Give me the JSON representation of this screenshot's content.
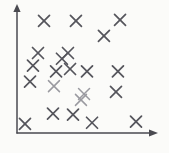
{
  "chart_data": {
    "type": "scatter",
    "title": "",
    "subtitle": "",
    "xlabel": "",
    "ylabel": "",
    "xlim": [
      0,
      100
    ],
    "ylim": [
      0,
      100
    ],
    "grid": false,
    "legend": null,
    "legend_position": "none",
    "tick_labels": {
      "x": [],
      "y": []
    },
    "annotations": [],
    "marker": "x",
    "marker_color": "#55555c",
    "axis_color": "#4a4a50",
    "background_color": "#fbfbf9",
    "point_count": 22,
    "series": [
      {
        "name": "points",
        "points": [
          {
            "x": 19.3,
            "y": 87.6,
            "faint": false
          },
          {
            "x": 42.1,
            "y": 87.6,
            "faint": false
          },
          {
            "x": 73.6,
            "y": 88.4,
            "faint": false
          },
          {
            "x": 62.1,
            "y": 75.9,
            "faint": false
          },
          {
            "x": 15.0,
            "y": 62.5,
            "faint": false
          },
          {
            "x": 36.4,
            "y": 62.5,
            "faint": false
          },
          {
            "x": 27.9,
            "y": 48.2,
            "faint": false
          },
          {
            "x": 37.9,
            "y": 50.0,
            "faint": false
          },
          {
            "x": 50.0,
            "y": 48.2,
            "faint": false
          },
          {
            "x": 72.1,
            "y": 48.2,
            "faint": false
          },
          {
            "x": 9.3,
            "y": 40.2,
            "faint": false
          },
          {
            "x": 45.7,
            "y": 25.9,
            "faint": true
          },
          {
            "x": 47.9,
            "y": 30.4,
            "faint": true
          },
          {
            "x": 70.7,
            "y": 32.1,
            "faint": false
          },
          {
            "x": 25.7,
            "y": 15.2,
            "faint": false
          },
          {
            "x": 40.0,
            "y": 14.3,
            "faint": false
          },
          {
            "x": 5.7,
            "y": 7.1,
            "faint": false
          },
          {
            "x": 53.6,
            "y": 8.0,
            "faint": false
          },
          {
            "x": 85.0,
            "y": 8.9,
            "faint": false
          },
          {
            "x": 11.4,
            "y": 52.7,
            "faint": false
          },
          {
            "x": 26.4,
            "y": 36.6,
            "faint": true
          },
          {
            "x": 32.1,
            "y": 58.0,
            "faint": false
          }
        ]
      }
    ]
  },
  "geometry": {
    "origin_x": 17,
    "origin_y": 133,
    "x_axis_end": 157,
    "y_axis_top": 5,
    "marker_radius": 5.5
  }
}
